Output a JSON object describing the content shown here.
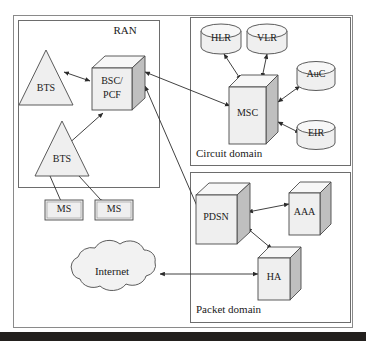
{
  "diagram": {
    "type": "network-architecture-diagram",
    "background_color": "#ffffff",
    "node_fill_color": "#efefef",
    "node_side_color": "#bfbfbf",
    "node_top_color": "#f7f7f7",
    "stroke_color": "#3b3b3b",
    "groups": [
      {
        "id": "ran",
        "label": "RAN",
        "label_pos": "top-right"
      },
      {
        "id": "circuit",
        "label": "Circuit domain",
        "label_pos": "bottom-left"
      },
      {
        "id": "packet",
        "label": "Packet domain",
        "label_pos": "bottom-left"
      }
    ],
    "nodes": [
      {
        "id": "bts_top",
        "label": "BTS",
        "shape": "triangle",
        "group": "ran"
      },
      {
        "id": "bts_bottom",
        "label": "BTS",
        "shape": "triangle",
        "group": "ran"
      },
      {
        "id": "bsc_pcf",
        "label_line1": "BSC/",
        "label_line2": "PCF",
        "label": "BSC/PCF",
        "shape": "cube",
        "group": "ran"
      },
      {
        "id": "ms_left",
        "label": "MS",
        "shape": "rect",
        "group": "none"
      },
      {
        "id": "ms_right",
        "label": "MS",
        "shape": "rect",
        "group": "none"
      },
      {
        "id": "hlr",
        "label": "HLR",
        "shape": "cylinder",
        "group": "circuit"
      },
      {
        "id": "vlr",
        "label": "VLR",
        "shape": "cylinder",
        "group": "circuit"
      },
      {
        "id": "auc",
        "label": "AuC",
        "shape": "cylinder",
        "group": "circuit"
      },
      {
        "id": "eir",
        "label": "EIR",
        "shape": "cylinder",
        "group": "circuit"
      },
      {
        "id": "msc",
        "label": "MSC",
        "shape": "cube",
        "group": "circuit"
      },
      {
        "id": "pdsn",
        "label": "PDSN",
        "shape": "cube",
        "group": "packet"
      },
      {
        "id": "aaa",
        "label": "AAA",
        "shape": "cube",
        "group": "packet"
      },
      {
        "id": "ha",
        "label": "HA",
        "shape": "cube",
        "group": "packet"
      },
      {
        "id": "internet",
        "label": "Internet",
        "shape": "cloud",
        "group": "none"
      }
    ],
    "links": [
      {
        "from": "bsc_pcf",
        "to": "bts_top",
        "arrow": "both"
      },
      {
        "from": "bts_bottom",
        "to": "bsc_pcf",
        "arrow": "both"
      },
      {
        "from": "ms_left",
        "to": "bts_bottom",
        "arrow": "both"
      },
      {
        "from": "ms_right",
        "to": "bts_bottom",
        "arrow": "both"
      },
      {
        "from": "bsc_pcf",
        "to": "msc",
        "arrow": "both"
      },
      {
        "from": "bsc_pcf",
        "to": "pdsn",
        "arrow": "both"
      },
      {
        "from": "hlr",
        "to": "msc",
        "arrow": "both"
      },
      {
        "from": "vlr",
        "to": "msc",
        "arrow": "both"
      },
      {
        "from": "msc",
        "to": "auc",
        "arrow": "both"
      },
      {
        "from": "msc",
        "to": "eir",
        "arrow": "both"
      },
      {
        "from": "pdsn",
        "to": "aaa",
        "arrow": "both"
      },
      {
        "from": "pdsn",
        "to": "ha",
        "arrow": "both"
      },
      {
        "from": "internet",
        "to": "ha",
        "arrow": "both"
      }
    ]
  },
  "labels": {
    "ran": "RAN",
    "circuit_domain": "Circuit domain",
    "packet_domain": "Packet domain",
    "bts_top": "BTS",
    "bts_bottom": "BTS",
    "bsc_line1": "BSC/",
    "bsc_line2": "PCF",
    "ms_left": "MS",
    "ms_right": "MS",
    "hlr": "HLR",
    "vlr": "VLR",
    "auc": "AuC",
    "eir": "EIR",
    "msc": "MSC",
    "pdsn": "PDSN",
    "aaa": "AAA",
    "ha": "HA",
    "internet": "Internet"
  }
}
